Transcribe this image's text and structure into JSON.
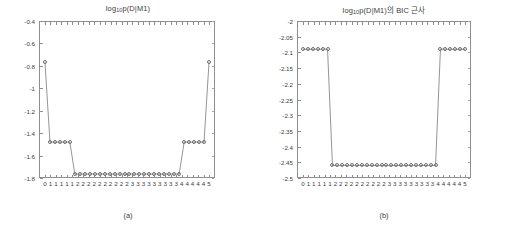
{
  "figure": {
    "background": "#ffffff",
    "axis_color": "#8e8e8e",
    "line_color": "#7a7a7a",
    "marker_color": "#6e6e6e"
  },
  "panels": [
    {
      "key": "a",
      "caption": "(a)",
      "title_main_1": "log",
      "title_sub": "10",
      "title_main_2": "p(D|M1)",
      "title_full": "log10p(D|M1)",
      "yticks": [
        "-0.4",
        "-0.6",
        "-0.8",
        "-1",
        "-1.2",
        "-1.4",
        "-1.6",
        "-1.8"
      ],
      "xticks": [
        "0",
        "1",
        "1",
        "1",
        "1",
        "1",
        "2",
        "2",
        "2",
        "2",
        "2",
        "2",
        "2",
        "2",
        "2",
        "2",
        "3",
        "3",
        "3",
        "3",
        "3",
        "3",
        "3",
        "3",
        "3",
        "4",
        "4",
        "4",
        "4",
        "4",
        "5"
      ]
    },
    {
      "key": "b",
      "caption": "(b)",
      "title_main_1": "log",
      "title_sub": "10",
      "title_main_2": "p(D|M1)의 BIC 근사",
      "title_full": "log10p(D|M1)의 BIC 근사",
      "yticks": [
        "-2",
        "-2.05",
        "-2.1",
        "-2.15",
        "-2.2",
        "-2.25",
        "-2.3",
        "-2.35",
        "-2.4",
        "-2.45",
        "-2.5"
      ],
      "xticks": [
        "0",
        "1",
        "1",
        "1",
        "1",
        "1",
        "2",
        "2",
        "2",
        "2",
        "2",
        "2",
        "2",
        "2",
        "2",
        "2",
        "3",
        "3",
        "3",
        "3",
        "3",
        "3",
        "3",
        "3",
        "3",
        "4",
        "4",
        "4",
        "4",
        "4",
        "5"
      ]
    }
  ],
  "chart_data": [
    {
      "type": "line",
      "title": "log10p(D|M1)",
      "subcaption": "(a)",
      "xlabel": "",
      "ylabel": "",
      "ylim": [
        -1.8,
        -0.4
      ],
      "ytick_step": 0.2,
      "grid": false,
      "legend": null,
      "marker": "circle-open",
      "x": [
        1,
        2,
        3,
        4,
        5,
        6,
        7,
        8,
        9,
        10,
        11,
        12,
        13,
        14,
        15,
        16,
        17,
        18,
        19,
        20,
        21,
        22,
        23,
        24,
        25,
        26,
        27,
        28,
        29,
        30,
        31,
        32,
        33,
        34
      ],
      "xtick_labels": [
        "0",
        "1",
        "1",
        "1",
        "1",
        "1",
        "2",
        "2",
        "2",
        "2",
        "2",
        "2",
        "2",
        "2",
        "2",
        "2",
        "3",
        "3",
        "3",
        "3",
        "3",
        "3",
        "3",
        "3",
        "3",
        "4",
        "4",
        "4",
        "4",
        "4",
        "5"
      ],
      "values": [
        -0.77,
        -1.48,
        -1.48,
        -1.48,
        -1.48,
        -1.48,
        -1.765,
        -1.765,
        -1.765,
        -1.765,
        -1.765,
        -1.765,
        -1.765,
        -1.765,
        -1.765,
        -1.765,
        -1.765,
        -1.765,
        -1.765,
        -1.765,
        -1.765,
        -1.765,
        -1.765,
        -1.765,
        -1.765,
        -1.765,
        -1.765,
        -1.765,
        -1.48,
        -1.48,
        -1.48,
        -1.48,
        -1.48,
        -0.77
      ]
    },
    {
      "type": "line",
      "title": "log10p(D|M1)의 BIC 근사",
      "subcaption": "(b)",
      "xlabel": "",
      "ylabel": "",
      "ylim": [
        -2.5,
        -2.0
      ],
      "ytick_step": 0.05,
      "grid": false,
      "legend": null,
      "marker": "circle-open",
      "x": [
        1,
        2,
        3,
        4,
        5,
        6,
        7,
        8,
        9,
        10,
        11,
        12,
        13,
        14,
        15,
        16,
        17,
        18,
        19,
        20,
        21,
        22,
        23,
        24,
        25,
        26,
        27,
        28,
        29,
        30,
        31,
        32,
        33,
        34
      ],
      "xtick_labels": [
        "0",
        "1",
        "1",
        "1",
        "1",
        "1",
        "2",
        "2",
        "2",
        "2",
        "2",
        "2",
        "2",
        "2",
        "2",
        "2",
        "3",
        "3",
        "3",
        "3",
        "3",
        "3",
        "3",
        "3",
        "3",
        "4",
        "4",
        "4",
        "4",
        "4",
        "5"
      ],
      "values": [
        -2.09,
        -2.09,
        -2.09,
        -2.09,
        -2.09,
        -2.09,
        -2.46,
        -2.46,
        -2.46,
        -2.46,
        -2.46,
        -2.46,
        -2.46,
        -2.46,
        -2.46,
        -2.46,
        -2.46,
        -2.46,
        -2.46,
        -2.46,
        -2.46,
        -2.46,
        -2.46,
        -2.46,
        -2.46,
        -2.46,
        -2.46,
        -2.46,
        -2.09,
        -2.09,
        -2.09,
        -2.09,
        -2.09,
        -2.09
      ]
    }
  ]
}
